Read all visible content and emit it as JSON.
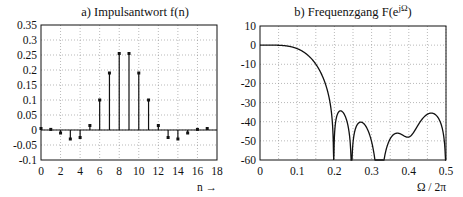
{
  "chart_data": [
    {
      "type": "stem",
      "title": "a) Impulsantwort f(n)",
      "xlabel": "n →",
      "ylabel": "",
      "xlim": [
        -1,
        18
      ],
      "ylim": [
        -0.1,
        0.35
      ],
      "grid": true,
      "x_ticks": [
        "0",
        "2",
        "4",
        "6",
        "8",
        "10",
        "12",
        "14",
        "16",
        "18"
      ],
      "y_ticks": [
        "0.35",
        "0.3",
        "0.25",
        "0.2",
        "0.15",
        "0.1",
        "0.05",
        "0",
        "-0.05",
        "-0.1"
      ],
      "x": [
        0,
        1,
        2,
        3,
        4,
        5,
        6,
        7,
        8,
        9,
        10,
        11,
        12,
        13,
        14,
        15,
        16,
        17
      ],
      "values": [
        0.005,
        0.002,
        -0.01,
        -0.03,
        -0.025,
        0.015,
        0.1,
        0.19,
        0.255,
        0.255,
        0.19,
        0.1,
        0.015,
        -0.025,
        -0.03,
        -0.01,
        0.002,
        0.005
      ]
    },
    {
      "type": "line",
      "title": "b) Frequenzgang F(e^jΩ)",
      "title_main": "b) Frequenzgang F(e",
      "title_sup": "jΩ",
      "title_end": ")",
      "xlabel": "Ω / 2π",
      "ylabel": "",
      "xlim": [
        0,
        0.5
      ],
      "ylim": [
        -60,
        10
      ],
      "grid": true,
      "x_ticks": [
        "0",
        "0.1",
        "0.2",
        "0.3",
        "0.4",
        "0.5"
      ],
      "y_ticks": [
        "10",
        "0",
        "-10",
        "-20",
        "-30",
        "-40",
        "-50",
        "-60"
      ],
      "description": "Magnitude response in dB of lowpass FIR; passband ~0 dB to ~0.05, falls to stopband edge ~0.2; stopband ripple peaks about -43 dB with zeros near 0.21, 0.24, 0.285, 0.335, 0.39, 0.445",
      "zeros": [
        0.21,
        0.24,
        0.285,
        0.335,
        0.39,
        0.445
      ],
      "sidelobe_peak_db": -43
    }
  ]
}
